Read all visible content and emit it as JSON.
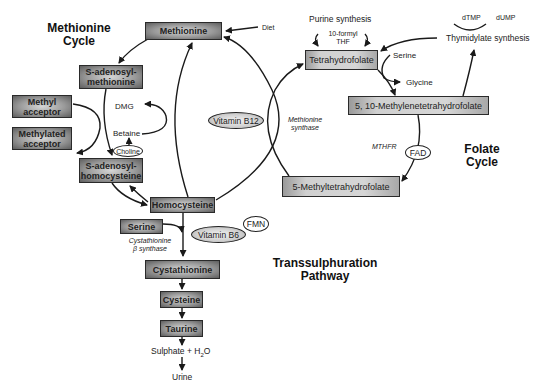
{
  "titles": {
    "methionine_cycle": "Methionine\nCycle",
    "methionine_cycle_l1": "Methionine",
    "methionine_cycle_l2": "Cycle",
    "folate_cycle_l1": "Folate",
    "folate_cycle_l2": "Cycle",
    "transsulphuration_l1": "Transsulphuration",
    "transsulphuration_l2": "Pathway"
  },
  "nodes": {
    "methionine": "Methionine",
    "sam_l1": "S-adenosyl-",
    "sam_l2": "methionine",
    "methyl_acceptor_l1": "Methyl",
    "methyl_acceptor_l2": "acceptor",
    "methylated_acceptor_l1": "Methylated",
    "methylated_acceptor_l2": "acceptor",
    "sah_l1": "S-adenosyl-",
    "sah_l2": "homocysteine",
    "homocysteine": "Homocysteine",
    "serine_box": "Serine",
    "cystathionine": "Cystathionine",
    "cysteine": "Cysteine",
    "taurine": "Taurine",
    "tetrahydrofolate": "Tetrahydrofolate",
    "methylene_thf": "5, 10-Methylenetetrahydrofolate",
    "methyl_thf": "5-Methyltetrahydrofolate"
  },
  "labels": {
    "diet": "Diet",
    "dmg": "DMG",
    "betaine": "Betaine",
    "purine_synthesis": "Purine synthesis",
    "formyl_thf_l1": "10-formyl",
    "formyl_thf_l2": "THF",
    "dtmp": "dTMP",
    "dump": "dUMP",
    "thymidylate_synthesis": "Thymidylate synthesis",
    "serine": "Serine",
    "glycine": "Glycine",
    "methionine_synthase_l1": "Methionine",
    "methionine_synthase_l2": "synthase",
    "mthfr": "MTHFR",
    "cbs_l1": "Cystathionine",
    "cbs_l2": "β synthase",
    "sulphate": "Sulphate + H",
    "sulphate_sub": "2",
    "sulphate_tail": "O",
    "urine": "Urine"
  },
  "cofactors": {
    "vitamin_b12": "Vitamin B12",
    "choline": "Choline",
    "fad": "FAD",
    "vitamin_b6": "Vitamin B6",
    "fmn": "FMN"
  }
}
